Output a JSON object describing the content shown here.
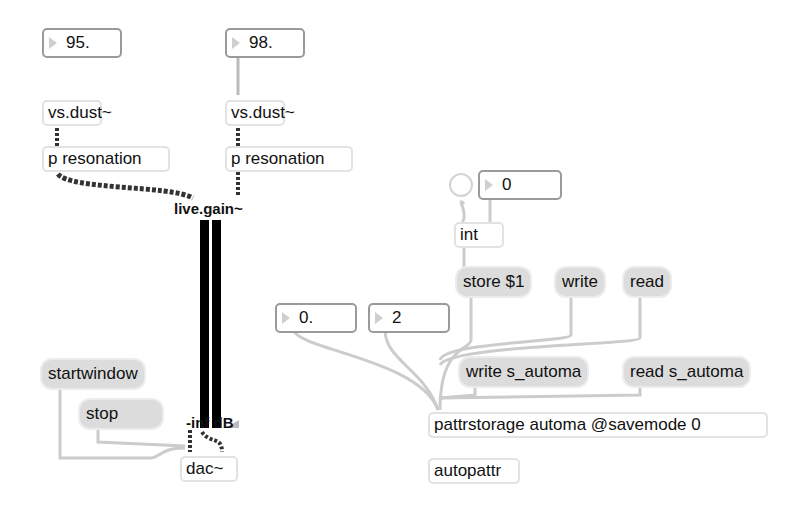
{
  "left_channel": {
    "label": "dust rate",
    "number_value": "95.",
    "dust_object": "vs.dust~",
    "resonation_object": "p resonation"
  },
  "right_channel": {
    "label": "dust rate",
    "number_value": "98.",
    "dust_object": "vs.dust~",
    "resonation_object": "p resonation"
  },
  "gain": {
    "title": "live.gain~",
    "readout": "-inf dB"
  },
  "transport": {
    "start_message": "startwindow",
    "stop_message": "stop",
    "dac_object": "dac~"
  },
  "preset": {
    "int_number_value": "0",
    "int_object": "int",
    "store_message": "store $1",
    "write_message": "write",
    "read_message": "read",
    "float_number_value": "0.",
    "int2_number_value": "2",
    "write_file_message": "write s_automa",
    "read_file_message": "read s_automa",
    "pattrstorage_object": "pattrstorage automa @savemode 0",
    "autopattr_object": "autopattr"
  },
  "colors": {
    "cord_audio": "#333333",
    "cord_control": "#c8c8c8",
    "message_bg": "#dcdcdc",
    "meter": "#000000"
  }
}
